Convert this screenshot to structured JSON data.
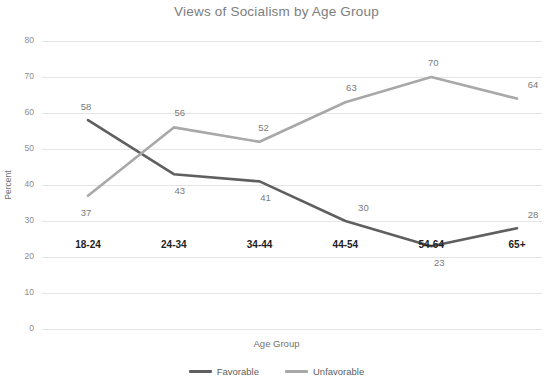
{
  "chart_data": {
    "type": "line",
    "title": "Views of Socialism by Age Group",
    "xlabel": "Age Group",
    "ylabel": "Percent",
    "categories": [
      "18-24",
      "24-34",
      "34-44",
      "44-54",
      "54-64",
      "65+"
    ],
    "series": [
      {
        "name": "Favorable",
        "color": "#5f5f5f",
        "values": [
          58,
          43,
          41,
          30,
          23,
          28
        ]
      },
      {
        "name": "Unfavorable",
        "color": "#a8a8a8",
        "values": [
          37,
          56,
          52,
          63,
          70,
          64
        ]
      }
    ],
    "ylim": [
      0,
      80
    ],
    "yticks": [
      0,
      10,
      20,
      30,
      40,
      50,
      60,
      70,
      80
    ],
    "ytick_labels": [
      "0",
      "10",
      "20",
      "30",
      "40",
      "50",
      "60",
      "70",
      "80"
    ],
    "grid": true,
    "legend_position": "bottom",
    "data_labels": true,
    "colors": {
      "title": "#7d7d7d",
      "gridline": "#e4e4e4",
      "axis_text": "#8d8d8d",
      "category_text": "#1e1e1e",
      "data_label": "#7a7a7a",
      "background": "#ffffff"
    }
  }
}
